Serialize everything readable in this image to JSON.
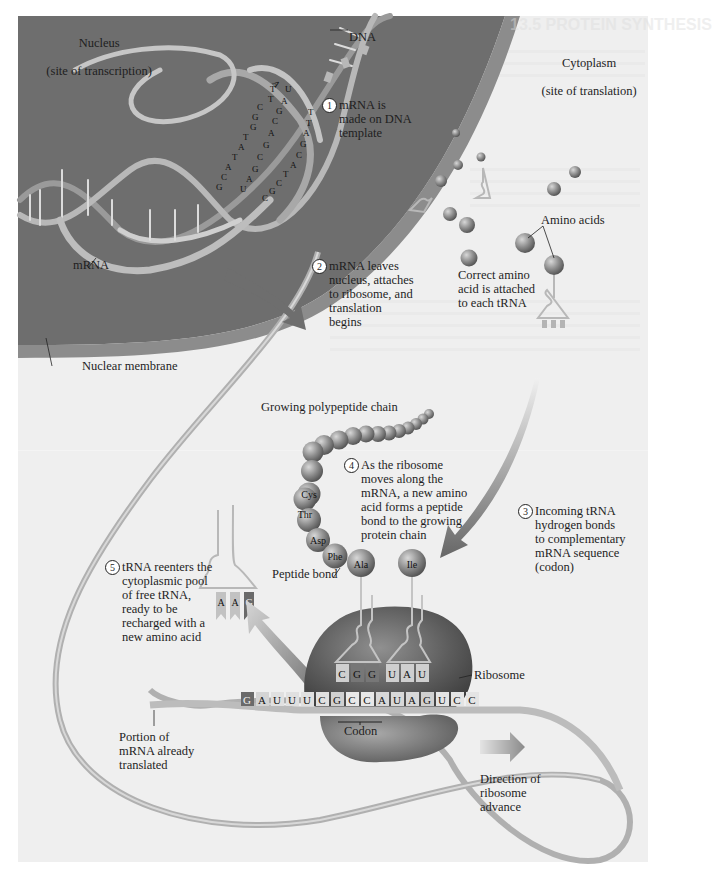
{
  "figure": {
    "regions": {
      "nucleus": {
        "line1": "Nucleus",
        "line2": "(site of transcription)"
      },
      "cytoplasm": {
        "line1": "Cytoplasm",
        "line2": "(site of translation)"
      },
      "nuclear_membrane": "Nuclear membrane"
    },
    "labels": {
      "dna": "DNA",
      "mrna": "mRNA",
      "amino_acids": "Amino acids",
      "correct_amino": "Correct amino\nacid is attached\nto each tRNA",
      "growing_chain": "Growing polypeptide chain",
      "peptide_bond": "Peptide bond",
      "ribosome": "Ribosome",
      "codon": "Codon",
      "portion_translated": "Portion of\nmRNA already\ntranslated",
      "direction": "Direction of\nribosome\nadvance"
    },
    "steps": [
      {
        "num": "1",
        "text": "mRNA is\nmade on DNA\ntemplate"
      },
      {
        "num": "2",
        "text": "mRNA leaves\nnucleus, attaches\nto ribosome, and\ntranslation\nbegins"
      },
      {
        "num": "3",
        "text": "Incoming tRNA\nhydrogen bonds\nto complementary\nmRNA sequence\n(codon)"
      },
      {
        "num": "4",
        "text": "As the ribosome\nmoves along the\nmRNA, a new amino\nacid forms a peptide\nbond to the growing\nprotein chain"
      },
      {
        "num": "5",
        "text": "tRNA reenters the\ncytoplasmic pool\nof free tRNA,\nready to be\nrecharged with a\nnew amino acid"
      }
    ],
    "amino_acid_chain": [
      "Cys",
      "Thr",
      "Asp",
      "Phe",
      "Ala"
    ],
    "incoming_amino_acid": "Ile",
    "released_trna_anticodon": [
      "A",
      "A",
      "G"
    ],
    "ribosome_trna_anticodons": [
      "C",
      "G",
      "G",
      "U",
      "A",
      "U"
    ],
    "mrna_sequence": [
      "G",
      "A",
      "U",
      "U",
      "U",
      "C",
      "G",
      "C",
      "C",
      "A",
      "U",
      "A",
      "G",
      "U",
      "C",
      "C"
    ],
    "dna_template_letters_left": [
      "A",
      "T",
      "T",
      "C",
      "G",
      "G",
      "T",
      "A",
      "T",
      "A",
      "C",
      "G",
      "G",
      "C",
      "C",
      "G",
      "T",
      "A",
      "A",
      "U"
    ],
    "dna_template_letters_right": [
      "U",
      "A",
      "A",
      "G",
      "G",
      "C",
      "T",
      "T",
      "A",
      "G",
      "C",
      "A",
      "T",
      "C",
      "G",
      "C",
      "A",
      "T"
    ],
    "ghost_text": {
      "heading": "13.5 PROTEIN SYNTHESIS"
    },
    "colors": {
      "nucleus": "#6e6e6e",
      "membrane": "#8a8a8a",
      "background": "#f0f0f0",
      "ribbon": "#b4b4b4",
      "sphere": "#8e8e8e",
      "ribosome": "#5a5a5a"
    }
  }
}
